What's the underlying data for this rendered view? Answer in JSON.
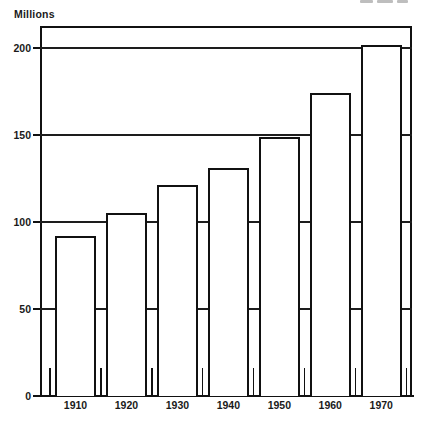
{
  "chart_data": {
    "type": "bar",
    "title": "",
    "subtitle": "",
    "xlabel": "",
    "ylabel": "Millions",
    "categories": [
      "1910",
      "1920",
      "1930",
      "1940",
      "1950",
      "1960",
      "1970"
    ],
    "values": [
      92,
      105,
      121,
      131,
      149,
      174,
      202
    ],
    "series": [
      {
        "name": "Population",
        "values": [
          92,
          105,
          121,
          131,
          149,
          174,
          202
        ]
      }
    ],
    "ylim": [
      0,
      213
    ],
    "ytick_values": [
      0,
      50,
      100,
      150,
      200
    ],
    "ytick_labels": [
      "0",
      "50",
      "100",
      "150",
      "200"
    ],
    "grid": "horizontal-major",
    "legend": "none",
    "bar_style": "hollow-outline",
    "annotations": []
  },
  "axes": {
    "y_unit_label": "Millions",
    "y_ticks": [
      {
        "label": "200",
        "value": 200
      },
      {
        "label": "150",
        "value": 150
      },
      {
        "label": "100",
        "value": 100
      },
      {
        "label": "50",
        "value": 50
      },
      {
        "label": "0",
        "value": 0
      }
    ],
    "x_ticks": [
      {
        "label": "1910"
      },
      {
        "label": "1920"
      },
      {
        "label": "1930"
      },
      {
        "label": "1940"
      },
      {
        "label": "1950"
      },
      {
        "label": "1960"
      },
      {
        "label": "1970"
      }
    ]
  },
  "style": {
    "ink": "#111111",
    "paper": "#ffffff",
    "gridline": "#1d1d1d"
  }
}
